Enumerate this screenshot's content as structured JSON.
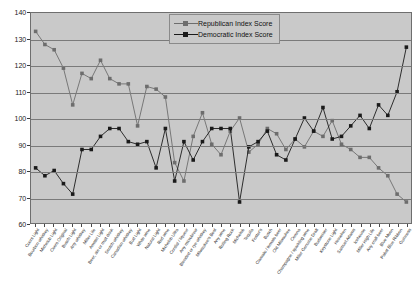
{
  "chart_data": {
    "type": "line",
    "title": "",
    "xlabel": "",
    "ylabel": "",
    "ylim": [
      60,
      140
    ],
    "ytick_values": [
      60,
      70,
      80,
      90,
      100,
      110,
      120,
      130,
      140
    ],
    "grid": true,
    "legend_position": "top-center",
    "plot_background": "#c9c9c9",
    "categories": [
      "Coors Light",
      "Bourbon whiskey",
      "Michelob Light",
      "Coors Original",
      "Busch Light",
      "Any whiskey",
      "Miller Lite",
      "Amstel Light",
      "Beer, ale or malt drink",
      "Scotch whiskey",
      "Canadian whiskey",
      "Bud Light",
      "White wine",
      "Natural Light",
      "Red wine",
      "Michelob Ultra",
      "Cordial / liqueur",
      "Any microbrew",
      "Blended or rye whiskey",
      "Milwaukee's Best",
      "Any wine",
      "Rolling Rock",
      "Michelob",
      "Tequila",
      "Foster's",
      "Busch",
      "Clamato / tomato beer",
      "Old Milwaukee",
      "Corona",
      "Champagne / sparkling wine",
      "Miller Genuine Draft",
      "Budweiser",
      "Keystone Light",
      "Heineken",
      "Samuel Adams",
      "Icehouse",
      "Miller High Life",
      "Any craft beer",
      "Blue Moon",
      "Pabst Blue Ribbon",
      "Guinness"
    ],
    "series": [
      {
        "name": "Republican Index Score",
        "color": "#6d6d6d",
        "marker": "square",
        "values": [
          133,
          128,
          126,
          119,
          105,
          117,
          115,
          122,
          115,
          113,
          113,
          97,
          112,
          111,
          108,
          83,
          76,
          93,
          102,
          90,
          86,
          95,
          100,
          87,
          90,
          96,
          94,
          88,
          92,
          89,
          95,
          93,
          99,
          90,
          88,
          85,
          85,
          81,
          78,
          71,
          68
        ]
      },
      {
        "name": "Democratic Index Score",
        "color": "#1a1a1a",
        "marker": "square",
        "values": [
          81,
          78,
          80,
          75,
          71,
          88,
          88,
          93,
          96,
          96,
          91,
          90,
          91,
          81,
          96,
          76,
          91,
          84,
          91,
          96,
          96,
          96,
          68,
          89,
          91,
          95,
          86,
          84,
          92,
          100,
          95,
          104,
          92,
          93,
          97,
          101,
          96,
          105,
          101,
          110,
          127
        ]
      }
    ]
  },
  "legend": {
    "entries": [
      {
        "label": "Republican Index Score"
      },
      {
        "label": "Democratic Index Score"
      }
    ]
  }
}
